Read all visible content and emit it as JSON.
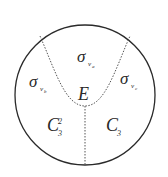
{
  "diagram": {
    "regions": [
      {
        "id": "sigma_va",
        "symbol": "σ",
        "subscript": "v",
        "subsubscript": "a"
      },
      {
        "id": "sigma_vb",
        "symbol": "σ",
        "subscript": "v",
        "subsubscript": "b"
      },
      {
        "id": "sigma_vc",
        "symbol": "σ",
        "subscript": "v",
        "subsubscript": "c"
      },
      {
        "id": "E",
        "symbol": "E"
      },
      {
        "id": "C3_2",
        "symbol": "C",
        "subscript": "3",
        "superscript": "2"
      },
      {
        "id": "C3",
        "symbol": "C",
        "subscript": "3"
      }
    ],
    "colors": {
      "outline": "#2a2a2a",
      "dotted": "#555555",
      "background": "#ffffff"
    }
  }
}
